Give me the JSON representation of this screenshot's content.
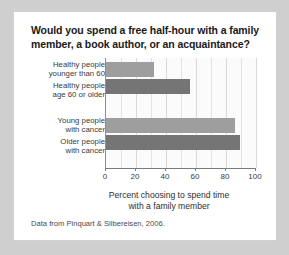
{
  "card": {
    "title": "Would you spend a free half-hour with a family member, a book author, or an acquaintance?",
    "title_line1": "Would you spend a free half-hour with a family",
    "title_line2": "member, a book author, or an acquaintance?",
    "source_note": "Data from Pinquart & Silbereisen, 2006."
  },
  "colors": {
    "bar_light": "#9e9e9e",
    "bar_dark": "#757575",
    "axis": "#7a7a7a",
    "gridline": "#e3e3e3",
    "card_background": "#ffffff",
    "page_background": "#cfcfcf",
    "plot_background": "#fbfbfb"
  },
  "chart_data": {
    "type": "bar",
    "orientation": "horizontal",
    "title": "Would you spend a free half-hour with a family member, a book author, or an acquaintance?",
    "categories": [
      "Healthy people younger than 60",
      "Healthy people age 60 or older",
      "Young people with cancer",
      "Older people with cancer"
    ],
    "category_lines": [
      [
        "Healthy people",
        "younger than 60"
      ],
      [
        "Healthy people",
        "age 60 or older"
      ],
      [
        "Young people",
        "with cancer"
      ],
      [
        "Older people",
        "with cancer"
      ]
    ],
    "values": [
      32,
      56,
      86,
      89
    ],
    "bar_colors": [
      "#9e9e9e",
      "#757575",
      "#9e9e9e",
      "#757575"
    ],
    "xlabel": "Percent choosing to spend time with a family member",
    "xlabel_line1": "Percent choosing to spend time",
    "xlabel_line2": "with a family member",
    "ylabel": "",
    "xlim": [
      0,
      100
    ],
    "xticks": [
      0,
      20,
      40,
      60,
      80,
      100
    ],
    "xtick_labels": [
      "0",
      "20",
      "40",
      "60",
      "80",
      "100"
    ],
    "minor_gridline_step": 10,
    "grid": true,
    "legend": false,
    "annotation": "Data from Pinquart & Silbereisen, 2006."
  }
}
